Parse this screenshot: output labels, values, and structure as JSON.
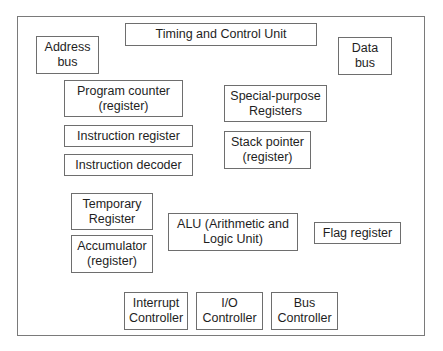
{
  "diagram": {
    "title": "",
    "components": {
      "timing_control": "Timing and Control Unit",
      "address_bus": "Address\nbus",
      "data_bus": "Data\nbus",
      "program_counter": "Program counter\n(register)",
      "instruction_register": "Instruction register",
      "instruction_decoder": "Instruction decoder",
      "special_purpose": "Special-purpose\nRegisters",
      "stack_pointer": "Stack pointer\n(register)",
      "temporary_register": "Temporary\nRegister",
      "accumulator": "Accumulator\n(register)",
      "alu": "ALU (Arithmetic and\nLogic Unit)",
      "flag_register": "Flag register",
      "interrupt_controller": "Interrupt\nController",
      "io_controller": "I/O\nController",
      "bus_controller": "Bus\nController"
    }
  }
}
